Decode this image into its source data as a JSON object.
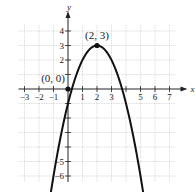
{
  "chart_data": {
    "type": "line",
    "title": "",
    "xlabel": "x",
    "ylabel": "y",
    "xlim": [
      -3,
      7
    ],
    "ylim": [
      -6,
      4
    ],
    "grid": true,
    "x_ticks": [
      -3,
      -2,
      -1,
      1,
      2,
      3,
      5,
      6,
      7
    ],
    "y_ticks": [
      1,
      2,
      3,
      4,
      -1,
      -2,
      -3,
      -4,
      -5,
      -6
    ],
    "x_tick_labels": [
      "−3",
      "−2",
      "−1",
      "1",
      "2",
      "3",
      "5",
      "6",
      "7"
    ],
    "y_tick_labels": [
      "4",
      "3",
      "2",
      "−5",
      "−6"
    ],
    "y_labeled_ticks": [
      4,
      3,
      2,
      -5,
      -6
    ],
    "series": [
      {
        "name": "parabola",
        "equation": "y = -(x - 2)^2 + 3",
        "vertex": [
          2,
          3
        ],
        "x_range": [
          -1.55,
          5.55
        ]
      }
    ],
    "points": [
      {
        "x": 0,
        "y": 0,
        "label": "(0, 0)"
      },
      {
        "x": 2,
        "y": 3,
        "label": "(2, 3)"
      }
    ]
  }
}
